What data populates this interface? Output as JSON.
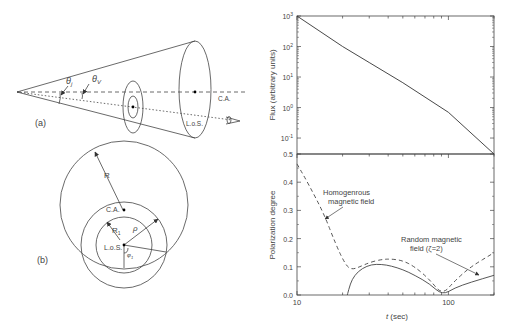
{
  "figure": {
    "panel_a": {
      "tag": "(a)",
      "labels": {
        "theta": "θ",
        "theta_sub": "j",
        "theta_v": "θ",
        "theta_v_sub": "V",
        "cone_axis": "C.A.",
        "line_of_sight": "L.o.S."
      },
      "icons": [
        "eye-icon"
      ]
    },
    "panel_b": {
      "tag": "(b)",
      "labels": {
        "R": "R",
        "R1": "R",
        "R1_sub": "1",
        "rho": "ρ",
        "phi": "φ",
        "phi_sub": "1",
        "cone_axis": "C.A.",
        "line_of_sight": "L.o.S."
      }
    }
  },
  "chart_data": [
    {
      "type": "line",
      "title": "",
      "xlabel": "",
      "ylabel": "Flux (arbitrary units)",
      "xscale": "log",
      "yscale": "log",
      "xlim": [
        10,
        200
      ],
      "ylim": [
        0.03,
        1000
      ],
      "ytick_labels": [
        "10^3",
        "10^2",
        "10^1",
        "10^0",
        "10^-1"
      ],
      "grid": false,
      "series": [
        {
          "name": "Flux",
          "style": "solid",
          "x": [
            10,
            20,
            30,
            50,
            100,
            200
          ],
          "y": [
            1000,
            100,
            30,
            6.5,
            0.7,
            0.03
          ]
        }
      ]
    },
    {
      "type": "line",
      "title": "",
      "xlabel": "t (sec)",
      "ylabel": "Polarization degree",
      "xscale": "log",
      "xlim": [
        10,
        200
      ],
      "ylim": [
        0.0,
        0.5
      ],
      "xtick_labels": [
        "10",
        "100"
      ],
      "ytick_labels": [
        "0.0",
        "0.1",
        "0.2",
        "0.3",
        "0.4",
        "0.5"
      ],
      "grid": false,
      "annotations": [
        {
          "text_line1": "Homogenrous",
          "text_line2": "magnetic field",
          "points_to": "dashed"
        },
        {
          "text_line1": "Random magnetic",
          "text_line2": "field (ζ=2)",
          "points_to": "solid"
        }
      ],
      "series": [
        {
          "name": "Homogenrous magnetic field",
          "style": "dashed",
          "x": [
            10,
            12,
            15,
            18,
            21,
            23,
            26,
            30,
            36,
            42,
            50,
            60,
            75,
            91,
            110,
            140,
            200
          ],
          "y": [
            0.465,
            0.39,
            0.29,
            0.18,
            0.105,
            0.09,
            0.1,
            0.115,
            0.126,
            0.128,
            0.122,
            0.1,
            0.055,
            0.0,
            0.05,
            0.1,
            0.15
          ]
        },
        {
          "name": "Random magnetic field (ζ=2)",
          "style": "solid",
          "x": [
            21.5,
            22.5,
            24,
            27,
            31,
            36,
            42,
            50,
            60,
            75,
            91,
            110,
            140,
            200
          ],
          "y": [
            0.0,
            0.04,
            0.07,
            0.095,
            0.108,
            0.109,
            0.103,
            0.09,
            0.07,
            0.04,
            0.0,
            0.025,
            0.045,
            0.07
          ]
        }
      ]
    }
  ]
}
